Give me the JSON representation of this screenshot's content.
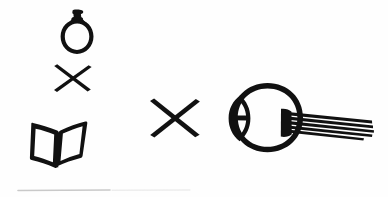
{
  "canvas": {
    "width": 388,
    "height": 197,
    "background_color": "#fefefe",
    "ink_color": "#111111",
    "faint_line_color": "#c9c9c9",
    "style": "hand-drawn black ink pictogram on white paper"
  },
  "figure": {
    "title": "Bottle times book times eye"
  },
  "elements": {
    "bottle": {
      "name": "bottle",
      "label": "bottle",
      "cap_label": "bottle-cap",
      "body_label": "bottle-body",
      "position": "top-left",
      "center_x": 78,
      "center_y": 33
    },
    "times_left": {
      "name": "multiplication-sign",
      "label": "×",
      "position": "left-middle",
      "center_x": 72,
      "center_y": 79,
      "size": "small"
    },
    "book": {
      "name": "open-book",
      "label": "open book",
      "left_page_label": "left-page",
      "right_page_label": "right-page",
      "spine_label": "book-spine",
      "position": "bottom-left",
      "center_x": 60,
      "center_y": 139
    },
    "times_center": {
      "name": "multiplication-sign",
      "label": "×",
      "position": "center",
      "center_x": 174,
      "center_y": 119,
      "size": "large"
    },
    "eye": {
      "name": "eyeball",
      "label": "eyeball with optic nerve",
      "globe_label": "eye-globe",
      "cornea_label": "cornea",
      "pupil_label": "pupil-slit",
      "nerve_label": "optic-nerve-fibers",
      "nerve_strand_count": 5,
      "position": "right",
      "center_x": 267,
      "center_y": 117
    },
    "scan_line": {
      "name": "scan-artifact-line",
      "label": "faint scan line",
      "position": "bottom-left",
      "x_start": 18,
      "x_end": 110,
      "y": 190
    }
  }
}
